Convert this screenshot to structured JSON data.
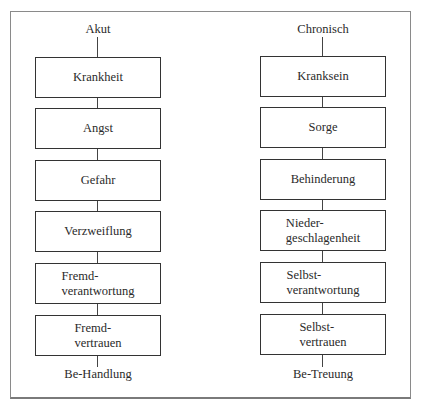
{
  "diagram": {
    "type": "two-column flow comparison",
    "left": {
      "header": "Akut",
      "nodes": [
        "Krankheit",
        "Angst",
        "Gefahr",
        "Verzweiflung",
        "Fremd-\nverantwortung",
        "Fremd-\nvertrauen"
      ],
      "footer": "Be-Handlung"
    },
    "right": {
      "header": "Chronisch",
      "nodes": [
        "Kranksein",
        "Sorge",
        "Behinderung",
        "Nieder-\ngeschlagenheit",
        "Selbst-\nverantwortung",
        "Selbst-\nvertrauen"
      ],
      "footer": "Be-Treuung"
    }
  }
}
